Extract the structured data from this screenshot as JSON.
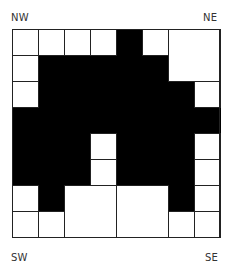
{
  "labels": {
    "nw": "NW",
    "ne": "NE",
    "sw": "SW",
    "se": "SE"
  },
  "grid": {
    "rows": 8,
    "cols": 8,
    "cell_px": 26,
    "colors": {
      "black": "#000000",
      "white": "#ffffff",
      "line": "#222222"
    },
    "black_cells": [
      [
        0,
        4
      ],
      [
        1,
        1
      ],
      [
        1,
        2
      ],
      [
        1,
        3
      ],
      [
        1,
        4
      ],
      [
        1,
        5
      ],
      [
        2,
        1
      ],
      [
        2,
        2
      ],
      [
        2,
        3
      ],
      [
        2,
        4
      ],
      [
        2,
        5
      ],
      [
        2,
        6
      ],
      [
        3,
        0
      ],
      [
        3,
        1
      ],
      [
        3,
        2
      ],
      [
        3,
        3
      ],
      [
        3,
        4
      ],
      [
        3,
        5
      ],
      [
        3,
        6
      ],
      [
        3,
        7
      ],
      [
        4,
        0
      ],
      [
        4,
        1
      ],
      [
        4,
        2
      ],
      [
        4,
        4
      ],
      [
        4,
        5
      ],
      [
        4,
        6
      ],
      [
        5,
        0
      ],
      [
        5,
        1
      ],
      [
        5,
        2
      ],
      [
        5,
        4
      ],
      [
        5,
        5
      ],
      [
        5,
        6
      ],
      [
        6,
        1
      ],
      [
        6,
        6
      ]
    ],
    "white_blocks": [
      {
        "r": 0,
        "c": 0,
        "h": 1,
        "w": 1
      },
      {
        "r": 0,
        "c": 1,
        "h": 1,
        "w": 1
      },
      {
        "r": 0,
        "c": 2,
        "h": 1,
        "w": 1
      },
      {
        "r": 0,
        "c": 3,
        "h": 1,
        "w": 1
      },
      {
        "r": 0,
        "c": 5,
        "h": 1,
        "w": 1
      },
      {
        "r": 0,
        "c": 6,
        "h": 2,
        "w": 2
      },
      {
        "r": 1,
        "c": 0,
        "h": 1,
        "w": 1
      },
      {
        "r": 2,
        "c": 0,
        "h": 1,
        "w": 1
      },
      {
        "r": 2,
        "c": 7,
        "h": 1,
        "w": 1
      },
      {
        "r": 4,
        "c": 3,
        "h": 1,
        "w": 1
      },
      {
        "r": 5,
        "c": 3,
        "h": 1,
        "w": 1
      },
      {
        "r": 4,
        "c": 7,
        "h": 1,
        "w": 1
      },
      {
        "r": 5,
        "c": 7,
        "h": 1,
        "w": 1
      },
      {
        "r": 6,
        "c": 7,
        "h": 1,
        "w": 1
      },
      {
        "r": 6,
        "c": 0,
        "h": 1,
        "w": 1
      },
      {
        "r": 6,
        "c": 2,
        "h": 2,
        "w": 2
      },
      {
        "r": 6,
        "c": 4,
        "h": 2,
        "w": 2
      },
      {
        "r": 7,
        "c": 0,
        "h": 1,
        "w": 1
      },
      {
        "r": 7,
        "c": 1,
        "h": 1,
        "w": 1
      },
      {
        "r": 7,
        "c": 6,
        "h": 1,
        "w": 1
      },
      {
        "r": 7,
        "c": 7,
        "h": 1,
        "w": 1
      }
    ]
  }
}
